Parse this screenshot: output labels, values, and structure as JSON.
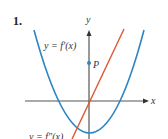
{
  "problem_number": "1.",
  "axes": {
    "x_label": "x",
    "y_label": "y"
  },
  "curves": [
    {
      "name": "f-prime",
      "label": "y = f′(x)",
      "color": "#2b86c2",
      "shape": "upward parabola"
    },
    {
      "name": "f-double-prime",
      "label": "y = f″(x)",
      "color": "#e0562f",
      "shape": "line through origin"
    }
  ],
  "point": {
    "label": "P",
    "color": "#2b86c2"
  },
  "colors": {
    "axis": "#555555",
    "text": "#333333"
  }
}
